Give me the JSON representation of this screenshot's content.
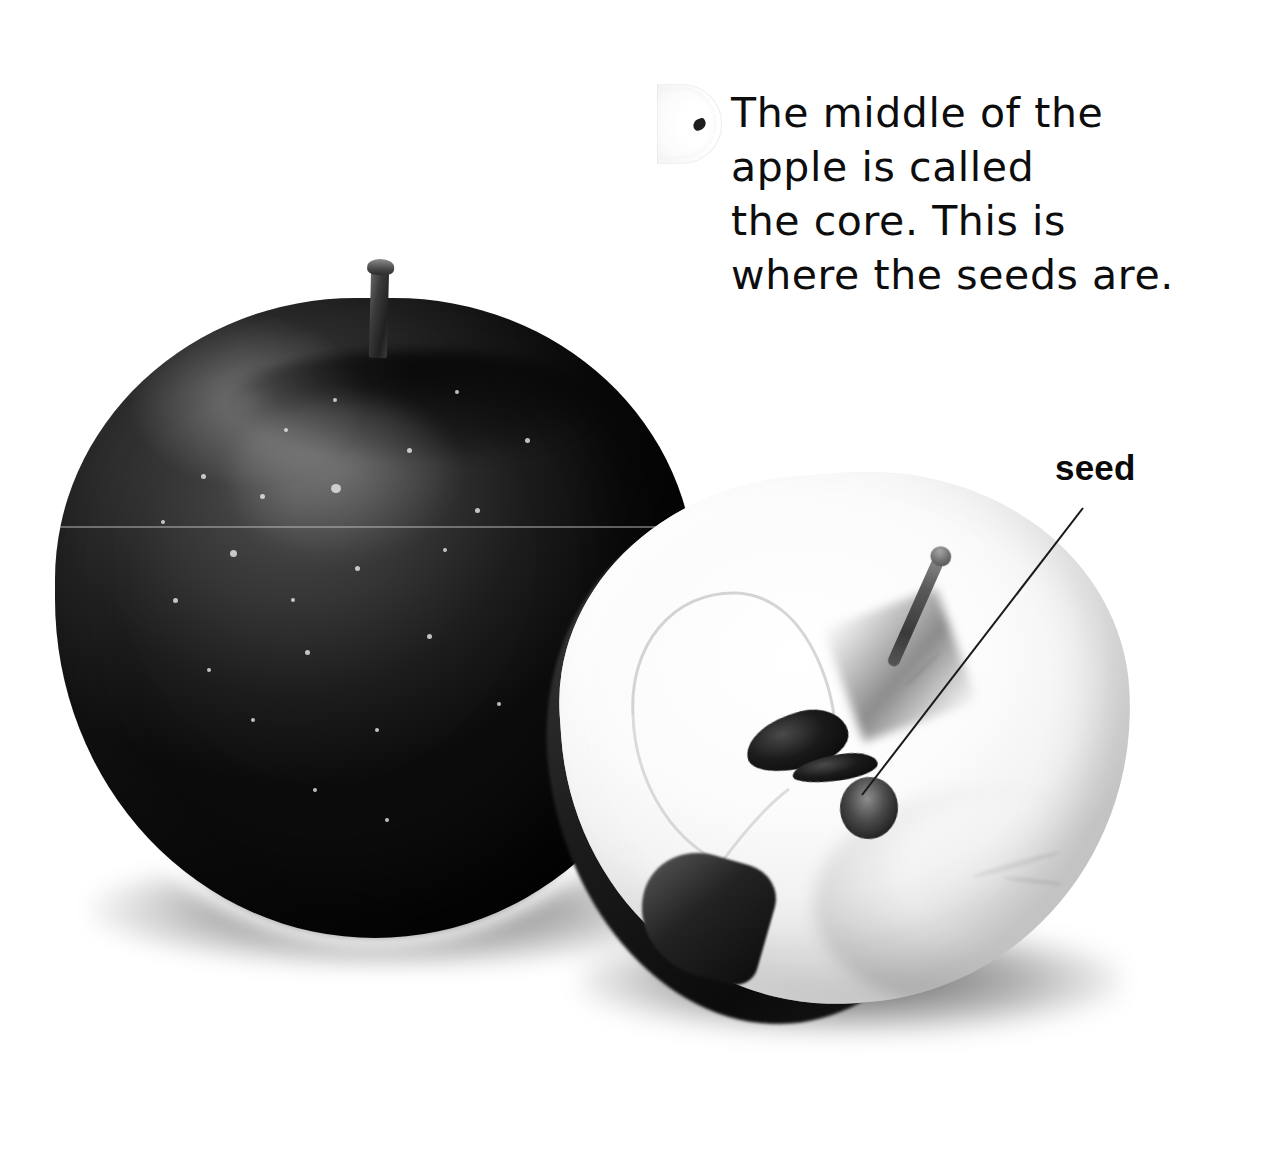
{
  "page": {
    "background_color": "#ffffff",
    "width": 1270,
    "height": 1150
  },
  "caption": {
    "lines": [
      "The middle of the",
      "apple is called",
      "the core. This is",
      "where the seeds are."
    ],
    "full_text": "The middle of the apple is called the core. This is where the seeds are.",
    "text_color": "#0d0d0d"
  },
  "callouts": [
    {
      "label": "seed",
      "label_color": "#0a0a0a",
      "leader_line_color": "#1a1a1a",
      "points_to": "apple-seed-in-core"
    }
  ],
  "photo": {
    "subjects": [
      {
        "name": "whole-apple",
        "description": "whole dark red apple with stem and pale lenticel speckles",
        "tone": "dark"
      },
      {
        "name": "half-apple",
        "description": "apple cut in half showing white flesh, core outline and dark seeds",
        "tone": "light"
      },
      {
        "name": "apple-slice-ghost",
        "description": "faint pale apple slice with a seed at the left of the caption",
        "tone": "very-light"
      }
    ],
    "colors": {
      "apple_skin": "#141414",
      "apple_flesh": "#fbfbfb",
      "seed": "#0a0a0a",
      "shadow": "#000000"
    }
  }
}
